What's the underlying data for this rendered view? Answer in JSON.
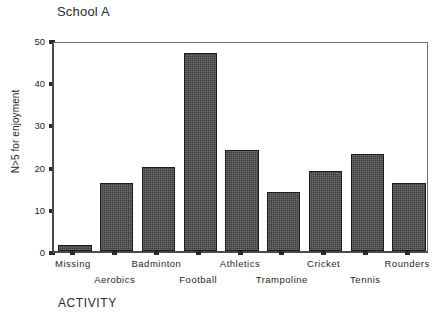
{
  "chart_data": {
    "type": "bar",
    "title": "School A",
    "xlabel": "ACTIVITY",
    "ylabel": "N>5 for enjoyment",
    "categories": [
      "Missing",
      "Aerobics",
      "Badminton",
      "Football",
      "Athletics",
      "Trampoline",
      "Cricket",
      "Tennis",
      "Rounders"
    ],
    "values": [
      1.5,
      16,
      20,
      47,
      24,
      14,
      19,
      23,
      16
    ],
    "ylim": [
      0,
      50
    ],
    "yticks": [
      0,
      10,
      20,
      30,
      40,
      50
    ],
    "ytick_labels": [
      "0",
      "10",
      "20",
      "30",
      "40",
      "50"
    ],
    "grid": false,
    "legend": false,
    "bar_color": "#3c3c3c",
    "bar_edge_color": "#1c1c1c",
    "axis_color": "#4a4a4a",
    "background": "#ffffff"
  }
}
